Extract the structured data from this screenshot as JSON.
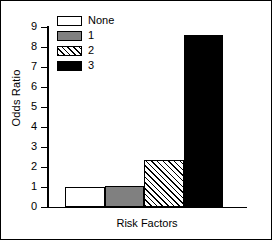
{
  "chart_data": {
    "type": "bar",
    "title": "",
    "xlabel": "Risk Factors",
    "ylabel": "Odds Ratio",
    "categories": [
      "None",
      "1",
      "2",
      "3"
    ],
    "values": [
      1.0,
      1.05,
      2.35,
      8.6
    ],
    "ylim": [
      0,
      9
    ],
    "yticks": [
      "0",
      "1",
      "2",
      "3",
      "4",
      "5",
      "6",
      "7",
      "8",
      "9"
    ],
    "xticks": [],
    "grid": false,
    "legend_position": "top-left-inside",
    "legend": [
      {
        "label": "None",
        "fill": "none"
      },
      {
        "label": "1",
        "fill": "gray"
      },
      {
        "label": "2",
        "fill": "hatch"
      },
      {
        "label": "3",
        "fill": "black"
      }
    ],
    "colors": {
      "none": "#ffffff",
      "gray": "#808080",
      "hatch": "#ffffff",
      "black": "#000000",
      "outline": "#000000"
    }
  }
}
